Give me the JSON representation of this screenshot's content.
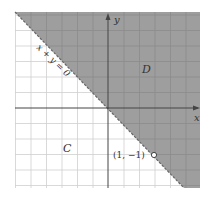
{
  "figure": {
    "type": "region-diagram",
    "boundary_line_label": "x + y = 0",
    "region_shaded_label": "D",
    "region_unshaded_label": "C",
    "x_axis_label": "x",
    "y_axis_label": "y",
    "point_label": "(1, −1)",
    "point": {
      "x": 1,
      "y": -1,
      "style": "open-circle"
    },
    "boundary_style": "dashed",
    "colors": {
      "shaded": "#9e9e9e",
      "grid_on_white": "#cfcfcf",
      "grid_on_shade": "#8c8c8c",
      "axis": "#444444",
      "frame_bg": "#ffffff"
    }
  }
}
